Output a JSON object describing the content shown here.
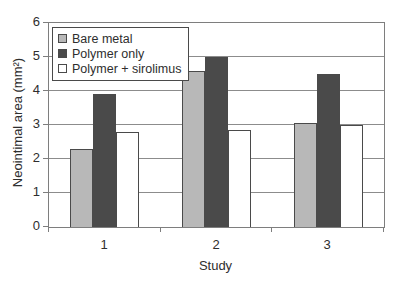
{
  "chart_data": {
    "type": "bar",
    "title": "",
    "categories": [
      "1",
      "2",
      "3"
    ],
    "series": [
      {
        "name": "Bare metal",
        "color": "#b8b8b8",
        "values": [
          2.3,
          4.6,
          3.05
        ]
      },
      {
        "name": "Polymer only",
        "color": "#4a4a4a",
        "values": [
          3.9,
          5.0,
          4.5
        ]
      },
      {
        "name": "Polymer + sirolimus",
        "color": "#ffffff",
        "values": [
          2.8,
          2.85,
          3.0
        ]
      }
    ],
    "xlabel": "Study",
    "ylabel": "Neointimal area (mm²)",
    "ylim": [
      0,
      6
    ],
    "yticks": [
      0,
      1,
      2,
      3,
      4,
      5,
      6
    ],
    "grid": true,
    "legend_position": "top-left"
  },
  "style": {
    "axis_color": "#7e7e7e",
    "grid_color": "#8c8c8c",
    "text_color": "#2e2e2e",
    "bar_border_color": "#4a4a4a",
    "background": "#ffffff"
  }
}
